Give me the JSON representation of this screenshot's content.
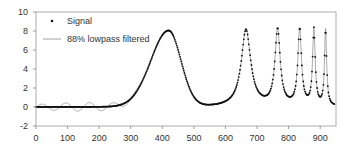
{
  "chart_data": {
    "type": "line",
    "title": "",
    "xlabel": "",
    "ylabel": "",
    "xlim": [
      0,
      950
    ],
    "ylim": [
      -2,
      10
    ],
    "x_ticks": [
      0,
      100,
      200,
      300,
      400,
      500,
      600,
      700,
      800,
      900
    ],
    "y_ticks": [
      -2,
      0,
      2,
      4,
      6,
      8,
      10
    ],
    "grid": false,
    "legend_position": "upper-left",
    "series": [
      {
        "name": "Signal",
        "style": "dots",
        "color": "#111111",
        "description": "Broad Gaussian peak (~8) centered near x=420 followed by increasingly narrow peaks (~8) near x=665, 765, 835, 880, 917; baseline ~0",
        "peaks": [
          {
            "x": 420,
            "y": 8.0,
            "width": 75
          },
          {
            "x": 665,
            "y": 8.1,
            "width": 18
          },
          {
            "x": 765,
            "y": 8.0,
            "width": 10
          },
          {
            "x": 835,
            "y": 8.0,
            "width": 7
          },
          {
            "x": 880,
            "y": 8.0,
            "width": 5
          },
          {
            "x": 917,
            "y": 8.0,
            "width": 4
          }
        ],
        "baseline": 0.0
      },
      {
        "name": "88% lowpass filtered",
        "style": "line",
        "color": "#888888",
        "description": "Follows signal with ringing/ripple of ±0.5 around baseline and overshoot near peaks"
      }
    ]
  },
  "legend": {
    "items": [
      {
        "label": "Signal",
        "symbol": "dot"
      },
      {
        "label": "88% lowpass filtered",
        "symbol": "line"
      }
    ]
  }
}
